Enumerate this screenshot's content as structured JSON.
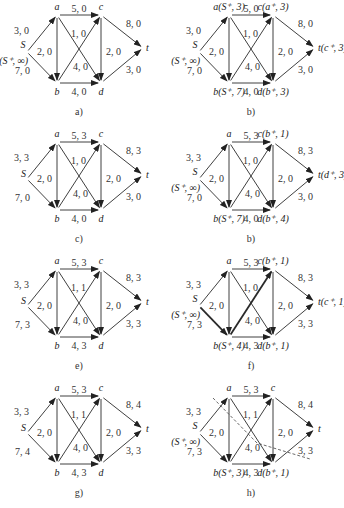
{
  "figure": {
    "edges_order": [
      "S-a",
      "S-b",
      "a-b",
      "a-c",
      "a-d",
      "b-c",
      "b-d",
      "c-d",
      "c-t",
      "d-t"
    ],
    "panels": [
      {
        "caption": "a)",
        "labels": {
          "S": "S",
          "S2": "(S⁺, ∞)",
          "a": "a",
          "b": "b",
          "c": "c",
          "d": "d",
          "t": "t"
        },
        "edges": {
          "Sa": "3, 0",
          "Sb": "7, 0",
          "ab": "2, 0",
          "ac": "5, 0",
          "ad": "4, 0",
          "bc": "1, 0",
          "bd": "4, 0",
          "cd": "2, 0",
          "ct": "8, 0",
          "dt": "3, 0"
        }
      },
      {
        "caption": "b)",
        "labels": {
          "S": "S",
          "S2": "(S⁺, ∞)",
          "a": "a(S⁺, 3)",
          "b": "b(S⁺, 7)",
          "c": "c(a⁺, 3)",
          "d": "d(b⁺, 3)",
          "t": "t(c⁺, 3)"
        },
        "edges": {
          "Sa": "3, 0",
          "Sb": "7, 0",
          "ab": "2, 0",
          "ac": "5, 0",
          "ad": "4, 0",
          "bc": "1, 0",
          "bd": "4, 0",
          "cd": "2, 0",
          "ct": "8, 0",
          "dt": "3, 0"
        }
      },
      {
        "caption": "c)",
        "labels": {
          "S": "S",
          "S2": "",
          "a": "a",
          "b": "b",
          "c": "c",
          "d": "d",
          "t": "t"
        },
        "edges": {
          "Sa": "3, 3",
          "Sb": "7, 0",
          "ab": "2, 0",
          "ac": "5, 3",
          "ad": "4, 0",
          "bc": "1, 0",
          "bd": "4, 0",
          "cd": "2, 0",
          "ct": "8, 3",
          "dt": "3, 0"
        }
      },
      {
        "caption": "b)",
        "labels": {
          "S": "S",
          "S2": "(S⁺, ∞)",
          "a": "a",
          "b": "b(S⁺, 7)",
          "c": "c(b⁺, 1)",
          "d": "d(b⁺, 4)",
          "t": "t(d⁺, 3)"
        },
        "edges": {
          "Sa": "3, 3",
          "Sb": "7, 0",
          "ab": "2, 0",
          "ac": "5, 3",
          "ad": "4, 0",
          "bc": "1, 0",
          "bd": "4, 0",
          "cd": "2, 0",
          "ct": "8, 3",
          "dt": "3, 0"
        }
      },
      {
        "caption": "e)",
        "labels": {
          "S": "S",
          "S2": "",
          "a": "a",
          "b": "b",
          "c": "c",
          "d": "d",
          "t": "t"
        },
        "edges": {
          "Sa": "3, 3",
          "Sb": "7, 3",
          "ab": "2, 0",
          "ac": "5, 3",
          "ad": "4, 0",
          "bc": "1, 1",
          "bd": "4, 3",
          "cd": "2, 0",
          "ct": "8, 3",
          "dt": "3, 3"
        }
      },
      {
        "caption": "f)",
        "labels": {
          "S": "S",
          "S2": "(S⁺, ∞)",
          "a": "a",
          "b": "b(S⁺, 4)",
          "c": "c(b⁺, 1)",
          "d": "d(b⁺, 1)",
          "t": "t(c⁺, 1)"
        },
        "edges": {
          "Sa": "3, 3",
          "Sb": "7, 3",
          "ab": "2, 0",
          "ac": "5, 3",
          "ad": "4, 0",
          "bc": "1, 0",
          "bd": "4, 3",
          "cd": "2, 0",
          "ct": "8, 3",
          "dt": "3, 3"
        }
      },
      {
        "caption": "g)",
        "labels": {
          "S": "S",
          "S2": "",
          "a": "a",
          "b": "b",
          "c": "c",
          "d": "d",
          "t": "t"
        },
        "edges": {
          "Sa": "3, 3",
          "Sb": "7, 4",
          "ab": "2, 0",
          "ac": "5, 3",
          "ad": "4, 0",
          "bc": "1, 1",
          "bd": "4, 3",
          "cd": "2, 0",
          "ct": "8, 4",
          "dt": "3, 3"
        }
      },
      {
        "caption": "h)",
        "labels": {
          "S": "S",
          "S2": "(S⁺, ∞)",
          "a": "a",
          "b": "b(S⁺, 3)",
          "c": "c",
          "d": "d(b⁺, 1)",
          "t": "t"
        },
        "edges": {
          "Sa": "3, 3",
          "Sb": "7, 3",
          "ab": "2, 0",
          "ac": "5, 3",
          "ad": "4, 0",
          "bc": "1, 1",
          "bd": "4, 3",
          "cd": "2, 0",
          "ct": "8, 4",
          "dt": "3, 3"
        }
      }
    ]
  }
}
